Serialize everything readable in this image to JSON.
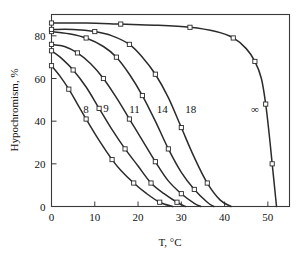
{
  "chart_data": {
    "type": "line",
    "title": "",
    "xlabel": "T, °C",
    "ylabel": "Hypochromism, %",
    "xlim": [
      0,
      55
    ],
    "ylim": [
      0,
      90
    ],
    "xticks": [
      0,
      10,
      20,
      30,
      40,
      50
    ],
    "yticks": [
      0,
      20,
      40,
      60,
      80
    ],
    "xtick_labels": [
      "0",
      "10",
      "20",
      "30",
      "40",
      "50"
    ],
    "ytick_labels": [
      "0",
      "20",
      "40",
      "60",
      "80"
    ],
    "grid": false,
    "legend": "inline-curve-labels",
    "marker": "open-square",
    "series": [
      {
        "name": "8",
        "label": "8",
        "label_x": 8.0,
        "label_y": 44.0,
        "x": [
          0,
          2,
          4,
          6,
          8,
          11,
          14,
          16,
          19,
          22,
          25,
          28
        ],
        "y": [
          66,
          61,
          55,
          48,
          41,
          31,
          22,
          17,
          11,
          6,
          2,
          0
        ]
      },
      {
        "name": "9",
        "label": "9",
        "label_x": 12.6,
        "label_y": 44.5,
        "x": [
          0,
          2,
          5,
          8,
          11,
          14,
          17,
          20,
          23,
          26,
          29,
          31
        ],
        "y": [
          73,
          70,
          64,
          56,
          46,
          36,
          27,
          19,
          11,
          6,
          2,
          0
        ]
      },
      {
        "name": "11",
        "label": "11",
        "label_x": 19.2,
        "label_y": 44.0,
        "x": [
          0,
          3,
          6,
          9,
          12,
          15,
          18,
          21,
          24,
          27,
          30,
          33,
          34.5
        ],
        "y": [
          76,
          75,
          72,
          67,
          60,
          51,
          41,
          31,
          21,
          12,
          6,
          1.5,
          0
        ]
      },
      {
        "name": "14",
        "label": "14",
        "label_x": 25.6,
        "label_y": 44.0,
        "x": [
          0,
          4,
          8,
          12,
          15,
          18,
          21,
          24,
          27,
          30,
          33,
          36,
          37.5
        ],
        "y": [
          82,
          81,
          79,
          75,
          70,
          62,
          52,
          40,
          27,
          16,
          8,
          2,
          0
        ]
      },
      {
        "name": "18",
        "label": "18",
        "label_x": 32.2,
        "label_y": 44.0,
        "x": [
          0,
          5,
          10,
          14,
          18,
          21,
          24,
          27,
          30,
          33,
          36,
          39,
          41.5
        ],
        "y": [
          83,
          83,
          82,
          80,
          76,
          70,
          62,
          51,
          37,
          23,
          11,
          3,
          0
        ]
      },
      {
        "name": "infinity",
        "label": "∞",
        "label_x": 47.0,
        "label_y": 44.0,
        "x": [
          0,
          8,
          16,
          24,
          32,
          38,
          42,
          45,
          47,
          48.5,
          49.5,
          50.3,
          51,
          51.6,
          52
        ],
        "y": [
          86,
          86,
          85.5,
          85,
          84,
          82,
          79,
          74,
          68,
          60,
          48,
          34,
          20,
          8,
          0
        ]
      }
    ]
  },
  "axis": {
    "x_label": "T, °C",
    "y_label": "Hypochromism, %"
  },
  "colors": {
    "curve": "#2b2b2b",
    "frame": "#3a3a3a",
    "background": "#ffffff",
    "marker_fill": "#ffffff"
  }
}
